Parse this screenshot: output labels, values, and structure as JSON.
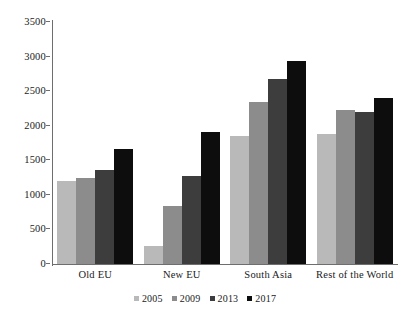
{
  "chart_data": {
    "type": "bar",
    "title": "",
    "xlabel": "",
    "ylabel": "",
    "categories": [
      "Old EU",
      "New EU",
      "South Asia",
      "Rest of the World"
    ],
    "series": [
      {
        "name": "2005",
        "color": "#b9b9b9",
        "values": [
          1200,
          255,
          1850,
          1880
        ]
      },
      {
        "name": "2009",
        "color": "#8c8c8c",
        "values": [
          1250,
          840,
          2340,
          2230
        ]
      },
      {
        "name": "2013",
        "color": "#3d3d3d",
        "values": [
          1360,
          1270,
          2670,
          2200
        ]
      },
      {
        "name": "2017",
        "color": "#0d0d0d",
        "values": [
          1660,
          1910,
          2940,
          2400
        ]
      }
    ],
    "ylim": [
      0,
      3500
    ],
    "yticks": [
      0,
      500,
      1000,
      1500,
      2000,
      2500,
      3000,
      3500
    ],
    "ytick_labels": [
      "0",
      "500",
      "1000",
      "1500",
      "2000",
      "2500",
      "3000",
      "3500"
    ],
    "grid": false,
    "legend_position": "bottom"
  }
}
